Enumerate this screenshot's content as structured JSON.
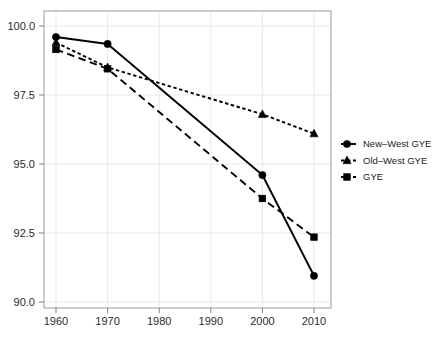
{
  "chart_data": {
    "type": "line",
    "title": "",
    "subtitle": "",
    "xlabel": "",
    "ylabel": "",
    "x": [
      1960,
      1970,
      1980,
      1990,
      2000,
      2010
    ],
    "xticklabels": [
      "1960",
      "1970",
      "1980",
      "1990",
      "2000",
      "2010"
    ],
    "xlim": [
      1955,
      2015
    ],
    "ylim": [
      89.4,
      100.5
    ],
    "yticks": [
      90.0,
      92.5,
      95.0,
      97.5,
      100.0
    ],
    "yticklabels": [
      "90.0",
      "92.5",
      "95.0",
      "97.5",
      "100.0"
    ],
    "grid": true,
    "legend_position": "right",
    "series": [
      {
        "name": "New–West GYE",
        "marker": "circle",
        "linestyle": "solid",
        "color": "#000000",
        "x": [
          1960,
          1970,
          2000,
          2010
        ],
        "values": [
          99.6,
          99.35,
          94.6,
          90.95
        ]
      },
      {
        "name": "Old–West GYE",
        "marker": "triangle",
        "linestyle": "dotted",
        "color": "#000000",
        "x": [
          1960,
          1970,
          2000,
          2010
        ],
        "values": [
          99.4,
          98.5,
          96.8,
          96.1
        ]
      },
      {
        "name": "GYE",
        "marker": "square",
        "linestyle": "dashed",
        "color": "#000000",
        "x": [
          1960,
          1970,
          2000,
          2010
        ],
        "values": [
          99.15,
          98.45,
          93.75,
          92.35
        ]
      }
    ]
  },
  "legend": {
    "entries": [
      {
        "label": "New–West GYE",
        "marker": "circle",
        "linestyle": "solid"
      },
      {
        "label": "Old–West GYE",
        "marker": "triangle",
        "linestyle": "dotted"
      },
      {
        "label": "GYE",
        "marker": "square",
        "linestyle": "dashed"
      }
    ]
  },
  "axes": {
    "y_tick_0": "90.0",
    "y_tick_1": "92.5",
    "y_tick_2": "95.0",
    "y_tick_3": "97.5",
    "y_tick_4": "100.0",
    "x_tick_0": "1960",
    "x_tick_1": "1970",
    "x_tick_2": "1980",
    "x_tick_3": "1990",
    "x_tick_4": "2000",
    "x_tick_5": "2010"
  },
  "colors": {
    "ink": "#000000",
    "panel_border": "#9a9a9a",
    "gridline": "#e6e6e6",
    "background": "#ffffff"
  }
}
